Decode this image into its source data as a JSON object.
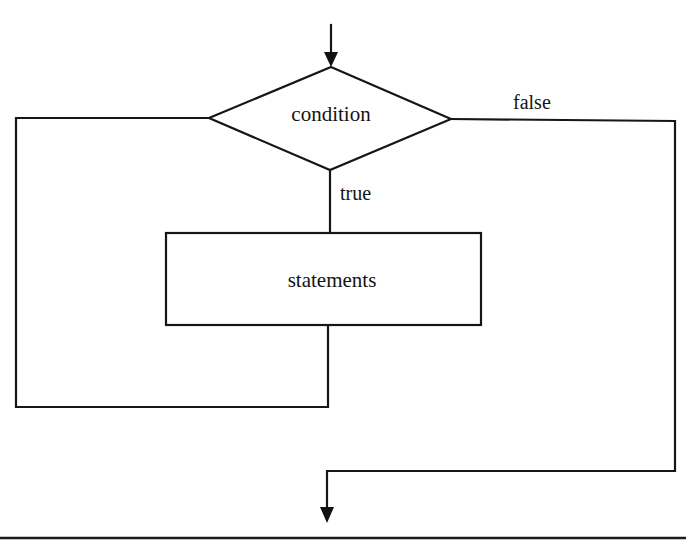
{
  "diagram": {
    "type": "flowchart",
    "nodes": {
      "condition": {
        "shape": "diamond",
        "label": "condition"
      },
      "statements": {
        "shape": "rectangle",
        "label": "statements"
      }
    },
    "edge_labels": {
      "true": "true",
      "false": "false"
    },
    "edges": [
      {
        "from": "entry",
        "to": "condition",
        "label": ""
      },
      {
        "from": "condition",
        "to": "statements",
        "label": "true"
      },
      {
        "from": "statements",
        "to": "condition",
        "label": "",
        "route": "loop back via left side"
      },
      {
        "from": "condition",
        "to": "exit",
        "label": "false",
        "route": "right side down to exit"
      }
    ],
    "colors": {
      "ink": "#161616",
      "background": "#ffffff"
    }
  }
}
